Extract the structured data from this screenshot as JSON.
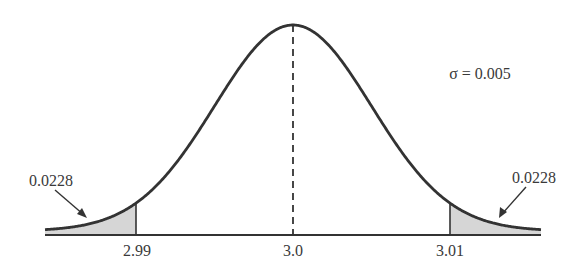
{
  "chart_data": {
    "type": "area",
    "title": "",
    "mean": 3.0,
    "sigma": 0.005,
    "sigma_label": "σ = 0.005",
    "x_ticks": [
      "2.99",
      "3.0",
      "3.01"
    ],
    "x_tick_values": [
      2.99,
      3.0,
      3.01
    ],
    "shaded_regions": [
      {
        "side": "left",
        "from": null,
        "to": 2.99,
        "area": 0.0228,
        "label": "0.0228"
      },
      {
        "side": "right",
        "from": 3.01,
        "to": null,
        "area": 0.0228,
        "label": "0.0228"
      }
    ],
    "mean_line": {
      "x": 3.0,
      "style": "dashed"
    },
    "xlabel": "",
    "ylabel": "",
    "grid": false
  },
  "colors": {
    "curve": "#333333",
    "shade": "#d6d6d6",
    "axis": "#333333",
    "text": "#3a3a3a"
  }
}
